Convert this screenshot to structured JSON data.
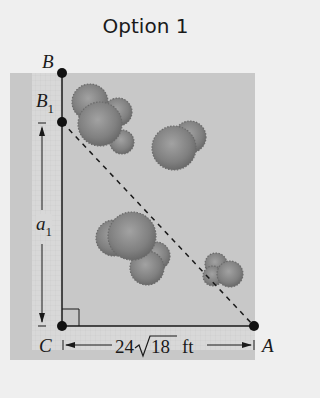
{
  "title": "Option 1",
  "points": {
    "B": {
      "label": "B"
    },
    "B1": {
      "label": "B",
      "subscript": "1"
    },
    "C": {
      "label": "C"
    },
    "A": {
      "label": "A"
    }
  },
  "dimensions": {
    "vertical": {
      "label": "a",
      "subscript": "1"
    },
    "horizontal": {
      "coefficient": "24",
      "radicand": "18",
      "unit": "ft"
    }
  },
  "colors": {
    "background": "#efefef",
    "panel": "#c8c8c8",
    "grid_strip": "#d6d6d6",
    "line": "#1a1a1a",
    "tree": "#7a7a7a"
  }
}
